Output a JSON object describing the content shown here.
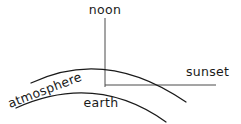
{
  "diagram": {
    "background_color": "#ffffff",
    "stroke_color": "#1a1a1a",
    "axis_color": "#4a4a4a",
    "labels": {
      "noon": "noon",
      "sunset": "sunset",
      "atmosphere": "atmosphere",
      "earth": "earth"
    },
    "label_positions": {
      "noon": {
        "x": 105,
        "y": 14,
        "rotation": 0,
        "anchor": "middle"
      },
      "sunset": {
        "x": 186,
        "y": 76,
        "rotation": 0,
        "anchor": "start"
      },
      "atmosphere": {
        "x": 10,
        "y": 108,
        "rotation": -21,
        "anchor": "start"
      },
      "earth": {
        "x": 101,
        "y": 107,
        "rotation": 0,
        "anchor": "middle"
      }
    },
    "lines": {
      "noon_axis": {
        "x1": 105,
        "y1": 18,
        "x2": 105,
        "y2": 87
      },
      "sunset_axis": {
        "x1": 105,
        "y1": 85,
        "x2": 216,
        "y2": 85
      }
    },
    "arcs": {
      "atmosphere_arc": {
        "name": "atmosphere",
        "start": {
          "x": 31,
          "y": 83
        },
        "control": {
          "x": 106,
          "y": 47
        },
        "end": {
          "x": 186,
          "y": 102
        }
      },
      "earth_arc": {
        "name": "earth",
        "start": {
          "x": 16,
          "y": 108
        },
        "control": {
          "x": 96,
          "y": 72
        },
        "end": {
          "x": 166,
          "y": 122
        }
      }
    }
  }
}
